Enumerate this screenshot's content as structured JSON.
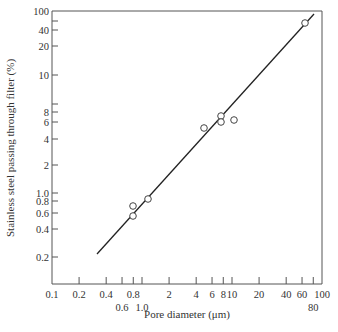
{
  "chart_data": {
    "type": "line",
    "title": "",
    "xlabel": "Pore diameter (μm)",
    "ylabel": "Stainless steel passing through filter (%)",
    "xscale": "log",
    "yscale": "log",
    "xlim": [
      0.1,
      100
    ],
    "ylim": [
      0.1,
      100
    ],
    "grid": false,
    "legend": null,
    "x_ticks": [
      {
        "value": 0.1,
        "label": "0.1",
        "row": 1
      },
      {
        "value": 0.2,
        "label": "0.2",
        "row": 1
      },
      {
        "value": 0.4,
        "label": "0.4",
        "row": 1
      },
      {
        "value": 0.6,
        "label": "0.6",
        "row": 2
      },
      {
        "value": 0.8,
        "label": "0.8",
        "row": 1
      },
      {
        "value": 1.0,
        "label": "1.0",
        "row": 2
      },
      {
        "value": 2,
        "label": "2",
        "row": 1
      },
      {
        "value": 4,
        "label": "4",
        "row": 1
      },
      {
        "value": 6,
        "label": "6",
        "row": 1
      },
      {
        "value": 8,
        "label": "8",
        "row": 1
      },
      {
        "value": 10,
        "label": "10",
        "row": 1
      },
      {
        "value": 20,
        "label": "20",
        "row": 1
      },
      {
        "value": 40,
        "label": "40",
        "row": 1
      },
      {
        "value": 60,
        "label": "60",
        "row": 1
      },
      {
        "value": 80,
        "label": "80",
        "row": 2
      },
      {
        "value": 100,
        "label": "100",
        "row": 1
      }
    ],
    "y_ticks": [
      {
        "value": 100,
        "label": "100",
        "py": 11
      },
      {
        "value": 60,
        "label": "",
        "py": 21
      },
      {
        "value": 40,
        "label": "40",
        "py": 30
      },
      {
        "value": 20,
        "label": "20",
        "py": 46
      },
      {
        "value": 10,
        "label": "10",
        "py": 75
      },
      {
        "value": 9,
        "label": "",
        "py": 104
      },
      {
        "value": 8,
        "label": "8",
        "py": 112
      },
      {
        "value": 6,
        "label": "6",
        "py": 122
      },
      {
        "value": 4,
        "label": "4",
        "py": 139
      },
      {
        "value": 2,
        "label": "2",
        "py": 165
      },
      {
        "value": 1.0,
        "label": "1.0",
        "py": 193
      },
      {
        "value": 0.8,
        "label": "0.8",
        "py": 201
      },
      {
        "value": 0.6,
        "label": "0.6",
        "py": 213
      },
      {
        "value": 0.4,
        "label": "0.4",
        "py": 229
      },
      {
        "value": 0.2,
        "label": "0.2",
        "py": 257
      }
    ],
    "series": [
      {
        "name": "Measured",
        "type": "scatter",
        "marker": "open-circle",
        "points": [
          {
            "x": 0.78,
            "y": 0.7,
            "px": 133,
            "py": 206
          },
          {
            "x": 0.78,
            "y": 0.55,
            "px": 133,
            "py": 216
          },
          {
            "x": 0.95,
            "y": 0.85,
            "px": 148,
            "py": 199
          },
          {
            "x": 4.8,
            "y": 5.2,
            "px": 204,
            "py": 128
          },
          {
            "x": 7.5,
            "y": 7.0,
            "px": 221,
            "py": 116
          },
          {
            "x": 7.5,
            "y": 6.2,
            "px": 221,
            "py": 122
          },
          {
            "x": 10.5,
            "y": 6.3,
            "px": 234,
            "py": 120
          },
          {
            "x": 65,
            "y": 47,
            "px": 305,
            "py": 23
          }
        ]
      },
      {
        "name": "Fit",
        "type": "line",
        "points": [
          {
            "x": 0.32,
            "y": 0.21,
            "px": 97,
            "py": 254
          },
          {
            "x": 85,
            "y": 90,
            "px": 314,
            "py": 14
          }
        ]
      }
    ]
  },
  "colors": {
    "axis": "#555555",
    "line": "#222222",
    "marker": "#444444",
    "background": "#ffffff"
  }
}
